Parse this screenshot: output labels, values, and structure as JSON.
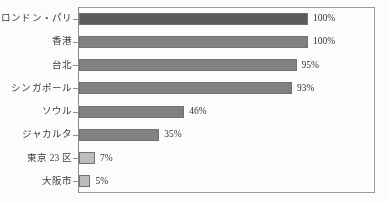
{
  "chart_data": {
    "type": "bar",
    "orientation": "horizontal",
    "title": "",
    "subtitle": "",
    "xlabel": "",
    "ylabel": "",
    "xlim": [
      0,
      100
    ],
    "grid": false,
    "legend": null,
    "unit": "%",
    "categories": [
      "ロンドン・パリ",
      "香港",
      "台北",
      "シンガポール",
      "ソウル",
      "ジャカルタ",
      "東京 23 区",
      "大阪市"
    ],
    "values": [
      100,
      100,
      95,
      93,
      46,
      35,
      7,
      5
    ],
    "value_labels": [
      "100%",
      "100%",
      "95%",
      "93%",
      "46%",
      "35%",
      "7%",
      "5%"
    ],
    "bar_colors": [
      "#595959",
      "#808080",
      "#808080",
      "#808080",
      "#808080",
      "#808080",
      "#bdbdbd",
      "#bdbdbd"
    ],
    "bar_border_color": "#6f6f6f",
    "axis_color": "#8f8f8f",
    "frame_color": "#9a9a9a",
    "background": "#fdfdfc",
    "text_color": "#3a3a3a"
  }
}
